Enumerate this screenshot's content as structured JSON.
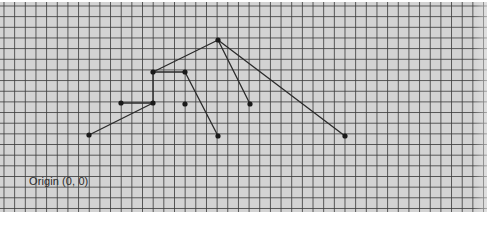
{
  "diagram": {
    "type": "graph-on-grid-paper",
    "grid": {
      "spacing_px": 10.67,
      "background_color": "#d3d3d3",
      "line_color": "#3c3c3c"
    },
    "origin_label": "Origin (0, 0)",
    "style": {
      "edge_color": "#2a2a2a",
      "node_color": "#1a1a1a",
      "edge_width": 1.3,
      "node_radius": 2.6
    },
    "nodes": [
      {
        "id": "n1",
        "x": 218,
        "y": 40
      },
      {
        "id": "n2",
        "x": 153,
        "y": 72
      },
      {
        "id": "n3",
        "x": 185,
        "y": 72
      },
      {
        "id": "n4",
        "x": 121,
        "y": 103
      },
      {
        "id": "n5",
        "x": 153,
        "y": 103
      },
      {
        "id": "n6",
        "x": 185,
        "y": 104
      },
      {
        "id": "n7",
        "x": 250,
        "y": 104
      },
      {
        "id": "n8",
        "x": 89,
        "y": 135
      },
      {
        "id": "n9",
        "x": 218,
        "y": 136
      },
      {
        "id": "n10",
        "x": 345,
        "y": 136
      }
    ],
    "edges": [
      {
        "from": "n2",
        "to": "n1"
      },
      {
        "from": "n2",
        "to": "n3"
      },
      {
        "from": "n2",
        "to": "n5"
      },
      {
        "from": "n4",
        "to": "n5"
      },
      {
        "from": "n8",
        "to": "n5"
      },
      {
        "from": "n3",
        "to": "n9"
      },
      {
        "from": "n1",
        "to": "n7"
      },
      {
        "from": "n1",
        "to": "n10"
      }
    ]
  }
}
